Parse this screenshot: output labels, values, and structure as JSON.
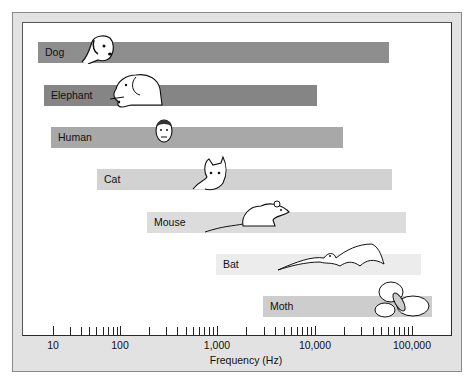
{
  "chart_data": {
    "type": "bar",
    "orientation": "horizontal-range",
    "title": "",
    "xlabel": "Frequency (Hz)",
    "ylabel": "",
    "xscale": "log",
    "xlim": [
      10,
      150000
    ],
    "xticks": [
      "10",
      "100",
      "1,000",
      "10,000",
      "100,000"
    ],
    "grid": false,
    "legend": null,
    "categories": [
      "Dog",
      "Elephant",
      "Human",
      "Cat",
      "Mouse",
      "Bat",
      "Moth"
    ],
    "series": [
      {
        "name": "low_hz",
        "values": [
          8,
          9,
          20,
          45,
          200,
          2000,
          3000
        ]
      },
      {
        "name": "high_hz",
        "values": [
          60000,
          12000,
          20000,
          64000,
          90000,
          120000,
          150000
        ]
      }
    ],
    "bars": [
      {
        "label": "Dog",
        "low": 8,
        "high": 60000,
        "color": "#8e8e8e",
        "x0": 38,
        "x1": 389,
        "y": 42,
        "icon": "dog-icon"
      },
      {
        "label": "Elephant",
        "low": 9,
        "high": 12000,
        "color": "#858585",
        "x0": 44,
        "x1": 317,
        "y": 85,
        "icon": "elephant-icon"
      },
      {
        "label": "Human",
        "low": 20,
        "high": 20000,
        "color": "#a8a8a8",
        "x0": 51,
        "x1": 343,
        "y": 127,
        "icon": "human-face-icon"
      },
      {
        "label": "Cat",
        "low": 45,
        "high": 64000,
        "color": "#d2d2d2",
        "x0": 97,
        "x1": 392,
        "y": 169,
        "icon": "cat-icon"
      },
      {
        "label": "Mouse",
        "low": 200,
        "high": 90000,
        "color": "#dcdcdc",
        "x0": 147,
        "x1": 406,
        "y": 212,
        "icon": "mouse-icon"
      },
      {
        "label": "Bat",
        "low": 2000,
        "high": 120000,
        "color": "#ececec",
        "x0": 216,
        "x1": 421,
        "y": 254,
        "icon": "bat-icon"
      },
      {
        "label": "Moth",
        "low": 3000,
        "high": 150000,
        "color": "#cdcdcd",
        "x0": 263,
        "x1": 432,
        "y": 296,
        "icon": "moth-icon"
      }
    ]
  },
  "axis": {
    "label": "Frequency (Hz)",
    "major": [
      {
        "label": "10",
        "x": 53
      },
      {
        "label": "100",
        "x": 120
      },
      {
        "label": "1,000",
        "x": 217
      },
      {
        "label": "10,000",
        "x": 315
      },
      {
        "label": "100,000",
        "x": 412
      }
    ],
    "minor_x": [
      70,
      81,
      89,
      96,
      103,
      108,
      113,
      117,
      149,
      166,
      177,
      186,
      193,
      199,
      204,
      209,
      213,
      246,
      264,
      275,
      284,
      291,
      297,
      302,
      307,
      311,
      344,
      361,
      373,
      381,
      388,
      394,
      399,
      404,
      408
    ]
  },
  "colors": {
    "panel": "#e2e2e2",
    "plot_bg": "#ffffff",
    "axis": "#222222"
  }
}
